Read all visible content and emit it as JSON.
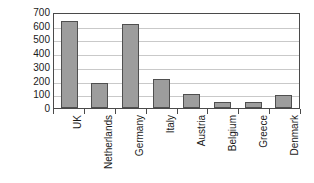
{
  "chart_data": {
    "type": "bar",
    "title": "",
    "xlabel": "",
    "ylabel": "EUR/pop",
    "categories": [
      "UK",
      "Netherlands",
      "Germany",
      "Italy",
      "Austria",
      "Belgium",
      "Greece",
      "Denmark"
    ],
    "values": [
      635,
      185,
      610,
      215,
      100,
      42,
      42,
      95
    ],
    "ylim": [
      0,
      700
    ],
    "ytick_labels": [
      "700",
      "600",
      "500",
      "400",
      "300",
      "200",
      "100",
      "0"
    ],
    "ytick_values": [
      700,
      600,
      500,
      400,
      300,
      200,
      100,
      0
    ],
    "ytick_step": 100,
    "grid": true,
    "legend": false,
    "legend_position": "none",
    "series": [
      {
        "name": "EUR/pop",
        "values": [
          635,
          185,
          610,
          215,
          100,
          42,
          42,
          95
        ]
      }
    ],
    "colors": {
      "bar_fill": "#9d9d9d",
      "bar_border": "#4f4f4f",
      "gridline": "#c9c9c9",
      "axis_frame": "#4a4a4a",
      "background": "#ffffff",
      "text": "#1a1a1a"
    }
  }
}
